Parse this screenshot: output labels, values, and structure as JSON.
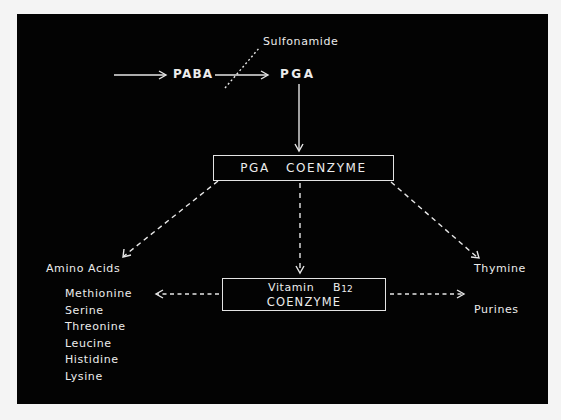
{
  "diagram": {
    "nodes": {
      "sulfonamide": "Sulfonamide",
      "paba": "PABA",
      "pga": "PGA",
      "pga_coenzyme": "PGA   COENZYME",
      "b12_line1_a": "Vitamin",
      "b12_line1_b": "B",
      "b12_line1_sub": "12",
      "b12_line2": "COENZYME",
      "amino_acids": "Amino Acids",
      "thymine": "Thymine",
      "purines": "Purines"
    },
    "amino_acid_list": [
      "Methionine",
      "Serine",
      "Threonine",
      "Leucine",
      "Histidine",
      "Lysine"
    ],
    "edges": [
      {
        "from": "input",
        "to": "PABA",
        "style": "solid"
      },
      {
        "from": "PABA",
        "to": "PGA",
        "style": "solid"
      },
      {
        "from": "Sulfonamide",
        "to": "PABA->PGA",
        "style": "dotted",
        "meaning": "inhibits"
      },
      {
        "from": "PGA",
        "to": "PGA COENZYME",
        "style": "solid"
      },
      {
        "from": "PGA COENZYME",
        "to": "Amino Acids",
        "style": "dashed"
      },
      {
        "from": "PGA COENZYME",
        "to": "Vitamin B12 COENZYME",
        "style": "dashed"
      },
      {
        "from": "PGA COENZYME",
        "to": "Thymine",
        "style": "dashed"
      },
      {
        "from": "Vitamin B12 COENZYME",
        "to": "Methionine",
        "style": "dashed"
      },
      {
        "from": "Vitamin B12 COENZYME",
        "to": "Purines",
        "style": "dashed"
      }
    ],
    "colors": {
      "background": "#030303",
      "foreground": "#ececec",
      "page": "#f4f4f4"
    }
  }
}
